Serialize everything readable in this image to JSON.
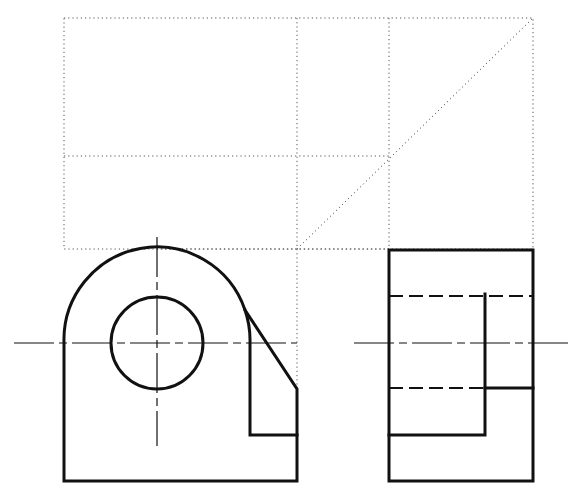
{
  "drawing": {
    "title": "Orthographic projection - front and side views with projection construction",
    "views": [
      {
        "name": "front-view",
        "label": "Front view"
      },
      {
        "name": "side-view",
        "label": "Right side view"
      }
    ],
    "line_types": {
      "construction": "dotted projection lines",
      "visible": "thick visible outlines",
      "hidden": "dashed hidden lines",
      "center": "thin chain center lines"
    },
    "colors": {
      "ink": "#111111",
      "construction": "#555555",
      "background": "#ffffff"
    }
  }
}
